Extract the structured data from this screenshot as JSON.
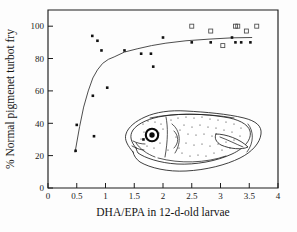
{
  "figure": {
    "background_color": "#fdfdfd",
    "frame_color": "#1c1c1c"
  },
  "chart_data": {
    "type": "scatter",
    "title": "",
    "subtitle": "",
    "xlabel": "DHA/EPA in 12-d-old larvae",
    "ylabel": "% Normal pigmenet turbot fry",
    "xlim": [
      0,
      4
    ],
    "ylim": [
      0,
      110
    ],
    "xticks": [
      0,
      0.5,
      1,
      1.5,
      2,
      2.5,
      3,
      3.5,
      4
    ],
    "xtick_labels": [
      "0",
      "0.5",
      "1",
      "1.5",
      "2",
      "2.5",
      "3",
      "3.5",
      "4"
    ],
    "yticks": [
      0,
      20,
      40,
      60,
      80,
      100
    ],
    "ytick_labels": [
      "0",
      "20",
      "40",
      "60",
      "80",
      "100"
    ],
    "grid": false,
    "legend": "none",
    "series": [
      {
        "name": "filled-squares",
        "marker": "filled square",
        "color": "#111111",
        "points": [
          {
            "x": 0.48,
            "y": 23
          },
          {
            "x": 0.5,
            "y": 39
          },
          {
            "x": 0.77,
            "y": 94
          },
          {
            "x": 0.78,
            "y": 57
          },
          {
            "x": 0.8,
            "y": 32
          },
          {
            "x": 0.86,
            "y": 91
          },
          {
            "x": 0.93,
            "y": 85
          },
          {
            "x": 1.03,
            "y": 62
          },
          {
            "x": 1.33,
            "y": 85
          },
          {
            "x": 1.62,
            "y": 83
          },
          {
            "x": 1.66,
            "y": 30
          },
          {
            "x": 1.79,
            "y": 83
          },
          {
            "x": 1.83,
            "y": 75
          },
          {
            "x": 2.0,
            "y": 93
          },
          {
            "x": 2.5,
            "y": 90
          },
          {
            "x": 2.83,
            "y": 90
          },
          {
            "x": 3.2,
            "y": 93
          },
          {
            "x": 3.26,
            "y": 90
          },
          {
            "x": 3.36,
            "y": 90
          },
          {
            "x": 3.52,
            "y": 90
          }
        ]
      },
      {
        "name": "open-squares",
        "marker": "open square",
        "color": "#4a4a4a",
        "points": [
          {
            "x": 2.5,
            "y": 100
          },
          {
            "x": 2.83,
            "y": 97
          },
          {
            "x": 3.04,
            "y": 88
          },
          {
            "x": 3.26,
            "y": 100
          },
          {
            "x": 3.3,
            "y": 100
          },
          {
            "x": 3.45,
            "y": 97
          },
          {
            "x": 3.63,
            "y": 100
          }
        ]
      }
    ],
    "fit_curve": {
      "name": "saturation fit",
      "style": "thin solid line",
      "color": "#3a3a3a",
      "points": [
        {
          "x": 0.47,
          "y": 22
        },
        {
          "x": 0.55,
          "y": 38
        },
        {
          "x": 0.62,
          "y": 50
        },
        {
          "x": 0.7,
          "y": 60
        },
        {
          "x": 0.78,
          "y": 68
        },
        {
          "x": 0.86,
          "y": 73
        },
        {
          "x": 0.95,
          "y": 77
        },
        {
          "x": 1.05,
          "y": 79.5
        },
        {
          "x": 1.15,
          "y": 81
        },
        {
          "x": 1.33,
          "y": 84
        },
        {
          "x": 1.55,
          "y": 86
        },
        {
          "x": 1.8,
          "y": 88
        },
        {
          "x": 2.05,
          "y": 89.5
        },
        {
          "x": 2.4,
          "y": 91
        },
        {
          "x": 2.8,
          "y": 92
        },
        {
          "x": 3.2,
          "y": 92.8
        },
        {
          "x": 3.55,
          "y": 93
        }
      ]
    }
  },
  "illustration": {
    "name": "turbot fry drawing",
    "description": "line drawing of a pigmented turbot fry with stippled body and dark eye"
  }
}
